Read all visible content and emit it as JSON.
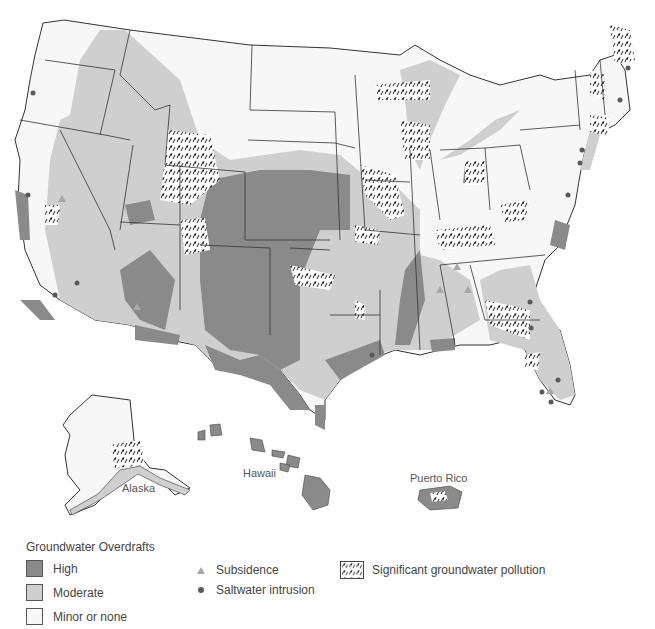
{
  "map": {
    "title": "Groundwater problems in the United States",
    "labels": {
      "alaska": "Alaska",
      "hawaii": "Hawaii",
      "puerto_rico": "Puerto Rico"
    },
    "colors": {
      "high": "#8a8a8a",
      "moderate": "#cfcfcf",
      "minor": "#f7f7f7",
      "border": "#333333",
      "subsidence": "#a8a8a8",
      "saltwater": "#5a5a5a"
    }
  },
  "legend": {
    "overdrafts_title": "Groundwater Overdrafts",
    "overdrafts": [
      {
        "label": "High",
        "color": "#8a8a8a"
      },
      {
        "label": "Moderate",
        "color": "#cfcfcf"
      },
      {
        "label": "Minor or none",
        "color": "#f7f7f7"
      }
    ],
    "symbols": [
      {
        "label": "Subsidence",
        "icon": "triangle-icon"
      },
      {
        "label": "Saltwater intrusion",
        "icon": "dot-icon"
      }
    ],
    "pollution": {
      "label": "Significant groundwater pollution",
      "icon": "hatch-pattern-icon"
    }
  }
}
